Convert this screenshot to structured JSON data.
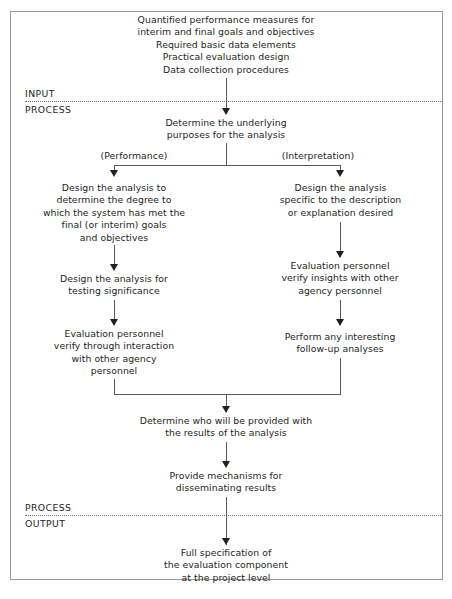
{
  "figure": {
    "frame_color": "#9a9a9a",
    "line_color": "#5a5a5a",
    "text_color": "#231f20"
  },
  "zones": [
    {
      "label": "INPUT"
    },
    {
      "label": "PROCESS"
    },
    {
      "label": "PROCESS"
    },
    {
      "label": "OUTPUT"
    }
  ],
  "nodes": {
    "input_block": "Quantified performance measures for\ninterim and final goals and objectives\nRequired basic data elements\nPractical evaluation design\nData collection procedures",
    "determine_purposes": "Determine the underlying\npurposes for the analysis",
    "branch_left_label": "(Performance)",
    "branch_right_label": "(Interpretation)",
    "left_design_analysis": "Design the analysis to\ndetermine the degree to\nwhich the system has met the\nfinal (or interim) goals\nand objectives",
    "left_testing_significance": "Design the analysis for\ntesting significance",
    "left_verify_interaction": "Evaluation personnel\nverify through interaction\nwith other agency\npersonnel",
    "right_design_analysis": "Design the analysis\nspecific to the description\nor explanation desired",
    "right_verify_insights": "Evaluation personnel\nverify insights with other\nagency personnel",
    "right_follow_up": "Perform any interesting\nfollow-up analyses",
    "determine_who": "Determine who will be provided with\nthe results of the analysis",
    "provide_mechanisms": "Provide mechanisms for\ndisseminating results",
    "output_block": "Full specification of\nthe evaluation component\nat the project level"
  }
}
